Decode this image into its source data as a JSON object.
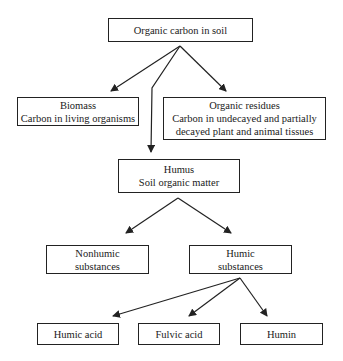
{
  "diagram": {
    "root": {
      "lines": [
        "Organic carbon in soil"
      ]
    },
    "biomass": {
      "lines": [
        "Biomass",
        "Carbon in living organisms"
      ]
    },
    "residues": {
      "lines": [
        "Organic residues",
        "Carbon in undecayed and partially",
        "decayed plant and animal tissues"
      ]
    },
    "humus": {
      "lines": [
        "Humus",
        "Soil organic matter"
      ]
    },
    "nonhumic": {
      "lines": [
        "Nonhumic",
        "substances"
      ]
    },
    "humic": {
      "lines": [
        "Humic",
        "substances"
      ]
    },
    "humic_acid": {
      "lines": [
        "Humic acid"
      ]
    },
    "fulvic_acid": {
      "lines": [
        "Fulvic acid"
      ]
    },
    "humin": {
      "lines": [
        "Humin"
      ]
    }
  },
  "colors": {
    "line": "#222222",
    "background": "#ffffff"
  }
}
